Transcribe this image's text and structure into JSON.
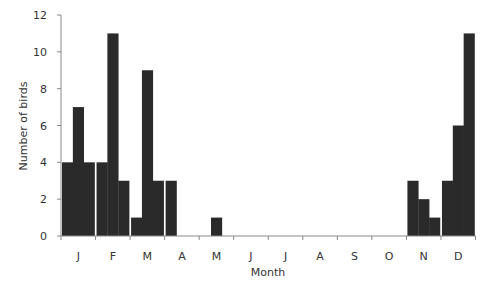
{
  "chart_data": {
    "type": "bar",
    "title": "",
    "xlabel": "Month",
    "ylabel": "Number of birds",
    "ylim": [
      0,
      12
    ],
    "yticks": [
      0,
      2,
      4,
      6,
      8,
      10,
      12
    ],
    "grid": false,
    "legend": null,
    "categories": [
      "J",
      "F",
      "M",
      "A",
      "M",
      "J",
      "J",
      "A",
      "S",
      "O",
      "N",
      "D"
    ],
    "bins_per_category": 3,
    "values": [
      [
        4,
        7,
        4
      ],
      [
        4,
        11,
        3
      ],
      [
        1,
        9,
        3
      ],
      [
        3,
        0,
        0
      ],
      [
        0,
        1,
        0
      ],
      [
        0,
        0,
        0
      ],
      [
        0,
        0,
        0
      ],
      [
        0,
        0,
        0
      ],
      [
        0,
        0,
        0
      ],
      [
        0,
        0,
        0
      ],
      [
        3,
        2,
        1
      ],
      [
        3,
        6,
        11
      ]
    ],
    "bar_color": "#2a2a2a"
  }
}
